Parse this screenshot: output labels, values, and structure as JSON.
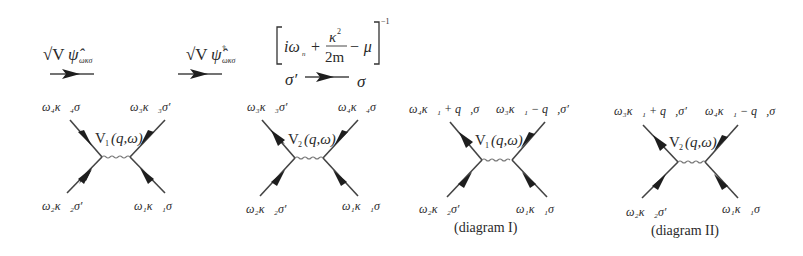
{
  "legend": {
    "annihilation": {
      "prefix": "√V",
      "operator": "ψ̂",
      "subscript": "ωκσ",
      "label": "√V ψ̂_{ωκσ}"
    },
    "creation": {
      "prefix": "√V",
      "operator": "ψ̂",
      "superscript": "†",
      "subscript": "ωκσ",
      "label": "√V ψ̂†_{ωκσ}"
    },
    "propagator": {
      "bracket_left": "[",
      "term1": "iω",
      "term1_sub": "n",
      "plus": "+",
      "numerator": "κ",
      "numerator_sup": "2",
      "denominator": "2m",
      "minus": "− μ",
      "bracket_right": "]",
      "exponent": "−1",
      "from_spin": "σ′",
      "to_spin": "σ",
      "label": "[iω_n + κ²/2m − μ]^{-1}"
    }
  },
  "diagrams": [
    {
      "id": "diagram-1",
      "vertex_label": "V",
      "vertex_sub": "1",
      "vertex_args": "(q,ω)",
      "top_left": "ω₄κ⃗₄σ",
      "top_right": "ω₃κ⃗₃σ′",
      "bottom_left": "ω₂κ⃗₂σ′",
      "bottom_right": "ω₁κ⃗₁σ",
      "caption": ""
    },
    {
      "id": "diagram-2",
      "vertex_label": "V",
      "vertex_sub": "2",
      "vertex_args": "(q,ω)",
      "top_left": "ω₃κ⃗₃σ′",
      "top_right": "ω₄κ⃗₄σ",
      "bottom_left": "ω₂κ⃗₂σ′",
      "bottom_right": "ω₁κ⃗₁σ",
      "caption": ""
    },
    {
      "id": "diagram-3",
      "vertex_label": "V",
      "vertex_sub": "1",
      "vertex_args": "(q,ω)",
      "top_left": "ω₄κ⃗₁ + q⃗,σ",
      "top_right": "ω₃κ⃗₁ − q⃗,σ′",
      "bottom_left": "ω₂κ⃗₂σ′",
      "bottom_right": "ω₁κ⃗₁σ",
      "caption": "(diagram I)"
    },
    {
      "id": "diagram-4",
      "vertex_label": "V",
      "vertex_sub": "2",
      "vertex_args": "(q,ω)",
      "top_left": "ω₃κ⃗₁ + q⃗,σ′",
      "top_right": "ω₄κ⃗₁ − q⃗,σ",
      "bottom_left": "ω₂κ⃗₂σ′",
      "bottom_right": "ω₁κ⃗₁σ",
      "caption": "(diagram II)"
    }
  ]
}
